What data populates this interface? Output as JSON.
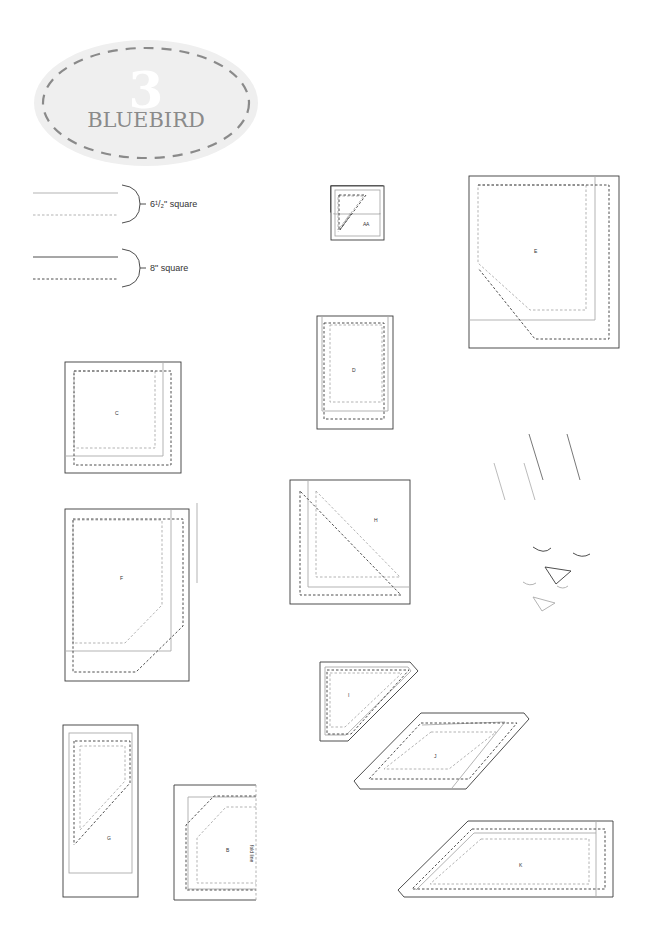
{
  "header": {
    "number": "3",
    "title": "BLUEBIRD"
  },
  "legend": {
    "items": [
      {
        "label": "6¹/₂\" square",
        "color": "#a9a9a9"
      },
      {
        "label": "8\" square",
        "color": "#3a3a3a"
      }
    ]
  },
  "colors": {
    "dark": "#3a3a3a",
    "gray": "#aaaaaa",
    "badge_fill": "#efefef",
    "badge_dash": "#8a8a8a",
    "title": "#8a8a8a"
  },
  "pieces": {
    "A": {
      "label": "A"
    },
    "B": {
      "label": "B",
      "fold": "fold line"
    },
    "C": {
      "label": "C"
    },
    "D": {
      "label": "D"
    },
    "E": {
      "label": "E"
    },
    "F": {
      "label": "F"
    },
    "G": {
      "label": "G"
    },
    "H": {
      "label": "H"
    },
    "I": {
      "label": "I"
    },
    "J": {
      "label": "J"
    },
    "K": {
      "label": "K"
    }
  }
}
